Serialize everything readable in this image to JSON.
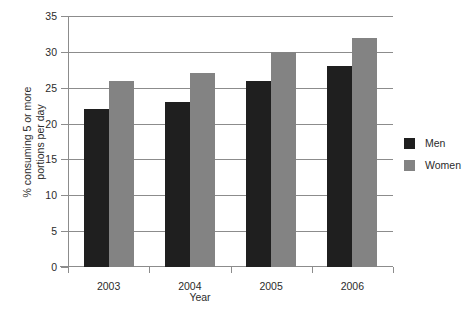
{
  "chart_data": {
    "type": "bar",
    "title": "",
    "subtitle": "",
    "xlabel": "Year",
    "ylabel": "% consuming 5 or more\nportions per day",
    "categories": [
      "2003",
      "2004",
      "2005",
      "2006"
    ],
    "series": [
      {
        "name": "Men",
        "values": [
          22,
          23,
          26,
          28
        ],
        "color": "#1f1f1f"
      },
      {
        "name": "Women",
        "values": [
          26,
          27,
          30,
          32
        ],
        "color": "#838383"
      }
    ],
    "ylim": [
      0,
      35
    ],
    "yticks": [
      0,
      5,
      10,
      15,
      20,
      25,
      30,
      35
    ],
    "ytick_labels": [
      "0",
      "5",
      "10",
      "15",
      "20",
      "25",
      "30",
      "35"
    ],
    "grid": true,
    "grid_axis": "y",
    "legend_position": "right",
    "axis_color": "#8c8c8c",
    "background": "#ffffff"
  }
}
